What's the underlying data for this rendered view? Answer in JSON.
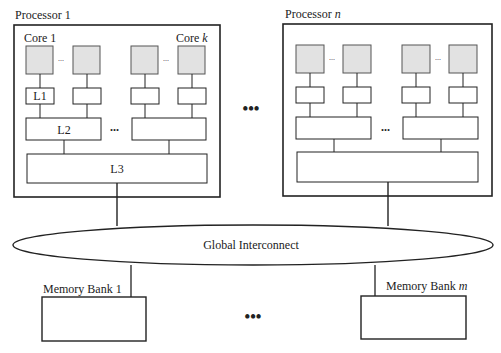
{
  "diagram": {
    "type": "multiprocessor-memory-hierarchy",
    "colors": {
      "stroke": "#222222",
      "core_fill": "#e2e2e2",
      "cache_fill": "#ffffff",
      "background": "#ffffff"
    },
    "processors": [
      {
        "title_prefix": "Processor",
        "title_index": "1",
        "first_core_label": "Core 1",
        "last_core_label_prefix": "Core",
        "last_core_label_index": "k",
        "l1_label": "L1",
        "l2_label": "L2",
        "l3_label": "L3",
        "core_ellipsis": "...",
        "l2_ellipsis": "..."
      },
      {
        "title_prefix": "Processor",
        "title_index": "n",
        "core_ellipsis": "...",
        "l2_ellipsis": "..."
      }
    ],
    "processor_ellipsis": "•••",
    "interconnect": {
      "label": "Global Interconnect"
    },
    "memory_banks": [
      {
        "label_prefix": "Memory Bank",
        "label_index": "1"
      },
      {
        "label_prefix": "Memory Bank",
        "label_index": "m"
      }
    ],
    "memory_ellipsis": "•••"
  }
}
